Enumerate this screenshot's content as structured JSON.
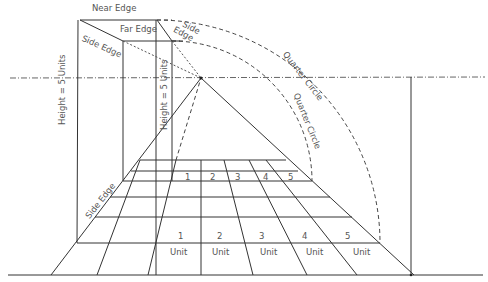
{
  "diagram": {
    "labels": {
      "near_edge": "Near Edge",
      "far_edge": "Far Edge",
      "side_edge_top": "Side Edge",
      "side_edge_right": "Side Edge",
      "side_edge_bottom": "Side Edge",
      "quarter_circle_outer": "Quarter Circle",
      "quarter_circle_inner": "Quarter Circle",
      "height_left": "Height = 5 Units",
      "height_right": "Height = 5 Units"
    },
    "far_row_numbers": [
      "1",
      "2",
      "3",
      "4",
      "5"
    ],
    "near_row_numbers": [
      "1",
      "2",
      "3",
      "4",
      "5"
    ],
    "unit_labels": [
      "Unit",
      "Unit",
      "Unit",
      "Unit",
      "Unit"
    ],
    "vanishing_point": {
      "x": 201,
      "y": 78
    },
    "horizon_y": 78,
    "ground_line_y": 275,
    "colors": {
      "line": "#333333",
      "text": "#555555",
      "background": "#ffffff"
    }
  }
}
